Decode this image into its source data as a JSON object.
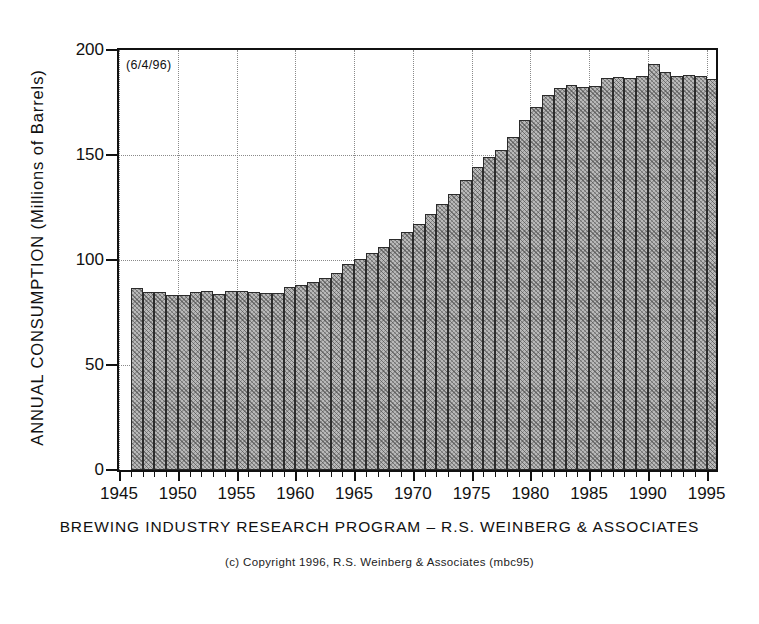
{
  "date_stamp": "(6/4/96)",
  "ylabel": "ANNUAL  CONSUMPTION  (Millions  of  Barrels)",
  "program_caption": "BREWING INDUSTRY RESEARCH PROGRAM  –  R.S. WEINBERG & ASSOCIATES",
  "copyright_caption": "(c) Copyright  1996, R.S. Weinberg  &  Associates  (mbc95)",
  "chart_data": {
    "type": "bar",
    "title": "",
    "subtitle": "",
    "xlabel": "",
    "ylabel": "ANNUAL CONSUMPTION (Millions of Barrels)",
    "xlim": [
      1945,
      1995.8
    ],
    "ylim": [
      0,
      200
    ],
    "yticks": [
      0,
      50,
      100,
      150,
      200
    ],
    "xticks": [
      1945,
      1950,
      1955,
      1960,
      1965,
      1970,
      1975,
      1980,
      1985,
      1990,
      1995
    ],
    "xtick_labels": [
      "1945",
      "1950",
      "1955",
      "1960",
      "1965",
      "1970",
      "1975",
      "1980",
      "1985",
      "1990",
      "1995"
    ],
    "ytick_labels": [
      "0",
      "50",
      "100",
      "150",
      "200"
    ],
    "grid": true,
    "grid_style": "dotted",
    "legend": false,
    "bar_fill": "#b9b9b9",
    "bar_edge": "#2b2b2b",
    "annotations": [
      {
        "text": "(6/4/96)",
        "position": "top-left-inside"
      }
    ],
    "categories": [
      1946,
      1947,
      1948,
      1949,
      1950,
      1951,
      1952,
      1953,
      1954,
      1955,
      1956,
      1957,
      1958,
      1959,
      1960,
      1961,
      1962,
      1963,
      1964,
      1965,
      1966,
      1967,
      1968,
      1969,
      1970,
      1971,
      1972,
      1973,
      1974,
      1975,
      1976,
      1977,
      1978,
      1979,
      1980,
      1981,
      1982,
      1983,
      1984,
      1985,
      1986,
      1987,
      1988,
      1989,
      1990,
      1991,
      1992,
      1993,
      1994,
      1995
    ],
    "values": [
      86.6,
      84.8,
      84.9,
      83.2,
      83.4,
      85.0,
      85.4,
      84.0,
      85.2,
      85.3,
      85.0,
      84.4,
      84.4,
      87.0,
      88.0,
      89.3,
      91.5,
      93.7,
      97.9,
      100.5,
      103.5,
      106.0,
      110.0,
      113.5,
      117.0,
      121.8,
      126.5,
      131.5,
      138.0,
      144.5,
      149.0,
      152.5,
      158.5,
      166.5,
      172.8,
      178.5,
      182.0,
      183.5,
      182.3,
      183.0,
      186.5,
      187.0,
      186.8,
      187.8,
      193.5,
      189.5,
      187.5,
      188.0,
      187.5,
      186.0
    ],
    "units": "millions of barrels",
    "series": [
      {
        "name": "Annual Consumption",
        "values": [
          86.6,
          84.8,
          84.9,
          83.2,
          83.4,
          85.0,
          85.4,
          84.0,
          85.2,
          85.3,
          85.0,
          84.4,
          84.4,
          87.0,
          88.0,
          89.3,
          91.5,
          93.7,
          97.9,
          100.5,
          103.5,
          106.0,
          110.0,
          113.5,
          117.0,
          121.8,
          126.5,
          131.5,
          138.0,
          144.5,
          149.0,
          152.5,
          158.5,
          166.5,
          172.8,
          178.5,
          182.0,
          183.5,
          182.3,
          183.0,
          186.5,
          187.0,
          186.8,
          187.8,
          193.5,
          189.5,
          187.5,
          188.0,
          187.5,
          186.0
        ]
      }
    ]
  }
}
